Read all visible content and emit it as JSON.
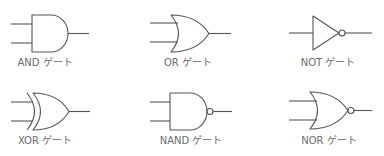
{
  "diagram": {
    "line_color": "#555555",
    "label_color": "#6a6a6a",
    "gates": [
      {
        "id": "and",
        "type": "AND",
        "label": "AND ゲート",
        "inputs": 2,
        "inverted_output": false
      },
      {
        "id": "or",
        "type": "OR",
        "label": "OR ゲート",
        "inputs": 2,
        "inverted_output": false
      },
      {
        "id": "not",
        "type": "NOT",
        "label": "NOT ゲート",
        "inputs": 1,
        "inverted_output": true
      },
      {
        "id": "xor",
        "type": "XOR",
        "label": "XOR ゲート",
        "inputs": 2,
        "inverted_output": false
      },
      {
        "id": "nand",
        "type": "NAND",
        "label": "NAND ゲート",
        "inputs": 2,
        "inverted_output": true
      },
      {
        "id": "nor",
        "type": "NOR",
        "label": "NOR ゲート",
        "inputs": 2,
        "inverted_output": true
      }
    ]
  }
}
